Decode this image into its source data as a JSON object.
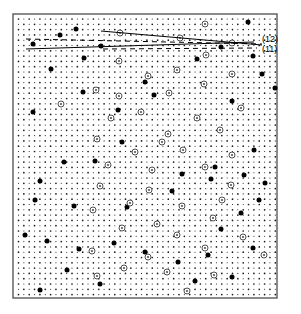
{
  "figure": {
    "type": "moire-lattice-diffraction-pattern",
    "background_color": "#ffffff",
    "frame": {
      "x": 13,
      "y": 14,
      "width": 264,
      "height": 284,
      "stroke_color": "#4d4d4d",
      "stroke_width": 1.3,
      "fill_color": "#ffffff"
    },
    "lattice": {
      "description": "dense square dot lattice filling the frame",
      "spacing_x": 5.35,
      "spacing_y": 5.3,
      "origin_x": 18.5,
      "origin_y": 19.0,
      "columns": 49,
      "rows": 53,
      "dot_radius": 0.85,
      "dot_color": "#1a1a1a",
      "alternating_radius": 0.55
    },
    "markers": {
      "filled_dot": {
        "name": "large-filled-dot",
        "radius": 2.5,
        "color": "#000000"
      },
      "circled_dot": {
        "name": "circled-dot",
        "outer_radius": 3.0,
        "inner_radius": 1.1,
        "stroke_color": "#3c3c3c",
        "stroke_width": 0.9,
        "inner_color": "#555555"
      }
    },
    "filled_dot_positions": [
      [
        248,
        22
      ],
      [
        60,
        35
      ],
      [
        76,
        29
      ],
      [
        101,
        46
      ],
      [
        253,
        56
      ],
      [
        33,
        44
      ],
      [
        221,
        47
      ],
      [
        145,
        82
      ],
      [
        84,
        58
      ],
      [
        197,
        59
      ],
      [
        51,
        69
      ],
      [
        275,
        88
      ],
      [
        262,
        74
      ],
      [
        83,
        92
      ],
      [
        154,
        95
      ],
      [
        232,
        101
      ],
      [
        118,
        110
      ],
      [
        33,
        112
      ],
      [
        122,
        142
      ],
      [
        283,
        119
      ],
      [
        64,
        162
      ],
      [
        95,
        161
      ],
      [
        254,
        150
      ],
      [
        215,
        167
      ],
      [
        297,
        135
      ],
      [
        40,
        181
      ],
      [
        244,
        175
      ],
      [
        182,
        174
      ],
      [
        172,
        191
      ],
      [
        211,
        179
      ],
      [
        265,
        183
      ],
      [
        35,
        200
      ],
      [
        259,
        200
      ],
      [
        74,
        206
      ],
      [
        241,
        213
      ],
      [
        288,
        196
      ],
      [
        127,
        207
      ],
      [
        221,
        229
      ],
      [
        25,
        235
      ],
      [
        47,
        241
      ],
      [
        79,
        249
      ],
      [
        114,
        243
      ],
      [
        253,
        248
      ],
      [
        208,
        255
      ],
      [
        178,
        262
      ],
      [
        145,
        252
      ],
      [
        279,
        266
      ],
      [
        67,
        270
      ],
      [
        100,
        284
      ],
      [
        40,
        290
      ],
      [
        195,
        281
      ],
      [
        232,
        277
      ],
      [
        283,
        232
      ]
    ],
    "circled_dot_positions": [
      [
        205,
        24
      ],
      [
        120,
        33
      ],
      [
        180,
        38
      ],
      [
        232,
        43
      ],
      [
        206,
        55
      ],
      [
        119,
        61
      ],
      [
        177,
        70
      ],
      [
        148,
        76
      ],
      [
        232,
        74
      ],
      [
        204,
        84
      ],
      [
        96,
        90
      ],
      [
        169,
        93
      ],
      [
        119,
        96
      ],
      [
        61,
        104
      ],
      [
        241,
        108
      ],
      [
        141,
        112
      ],
      [
        197,
        118
      ],
      [
        111,
        118
      ],
      [
        220,
        130
      ],
      [
        168,
        134
      ],
      [
        97,
        139
      ],
      [
        162,
        142
      ],
      [
        135,
        152
      ],
      [
        183,
        150
      ],
      [
        232,
        155
      ],
      [
        108,
        165
      ],
      [
        152,
        170
      ],
      [
        205,
        167
      ],
      [
        231,
        185
      ],
      [
        100,
        186
      ],
      [
        149,
        190
      ],
      [
        222,
        200
      ],
      [
        130,
        203
      ],
      [
        182,
        206
      ],
      [
        93,
        210
      ],
      [
        213,
        218
      ],
      [
        157,
        224
      ],
      [
        122,
        228
      ],
      [
        177,
        235
      ],
      [
        243,
        237
      ],
      [
        205,
        248
      ],
      [
        92,
        251
      ],
      [
        148,
        257
      ],
      [
        264,
        255
      ],
      [
        124,
        268
      ],
      [
        167,
        272
      ],
      [
        214,
        275
      ],
      [
        97,
        276
      ],
      [
        187,
        291
      ]
    ],
    "annotation_lines": [
      {
        "name": "line-12",
        "style": "solid",
        "x1": 101,
        "y1": 31,
        "x2": 262,
        "y2": 45,
        "stroke_color": "#000000",
        "stroke_width": 1.0
      },
      {
        "name": "line-12-dashed",
        "style": "dashed",
        "x1": 26,
        "y1": 39,
        "x2": 262,
        "y2": 44,
        "stroke_color": "#000000",
        "stroke_width": 1.0,
        "dash_array": "5 4"
      },
      {
        "name": "line-11",
        "style": "solid",
        "x1": 26,
        "y1": 49,
        "x2": 254,
        "y2": 42,
        "stroke_color": "#000000",
        "stroke_width": 1.0
      },
      {
        "name": "line-11-dashed",
        "style": "dashed",
        "x1": 103,
        "y1": 49,
        "x2": 257,
        "y2": 48,
        "stroke_color": "#000000",
        "stroke_width": 1.0,
        "dash_array": "5 4"
      }
    ],
    "labels": [
      {
        "name": "label-12",
        "text": "(12)",
        "x": 262,
        "y": 42
      },
      {
        "name": "label-11",
        "text": "(11)",
        "x": 262,
        "y": 52
      }
    ]
  }
}
